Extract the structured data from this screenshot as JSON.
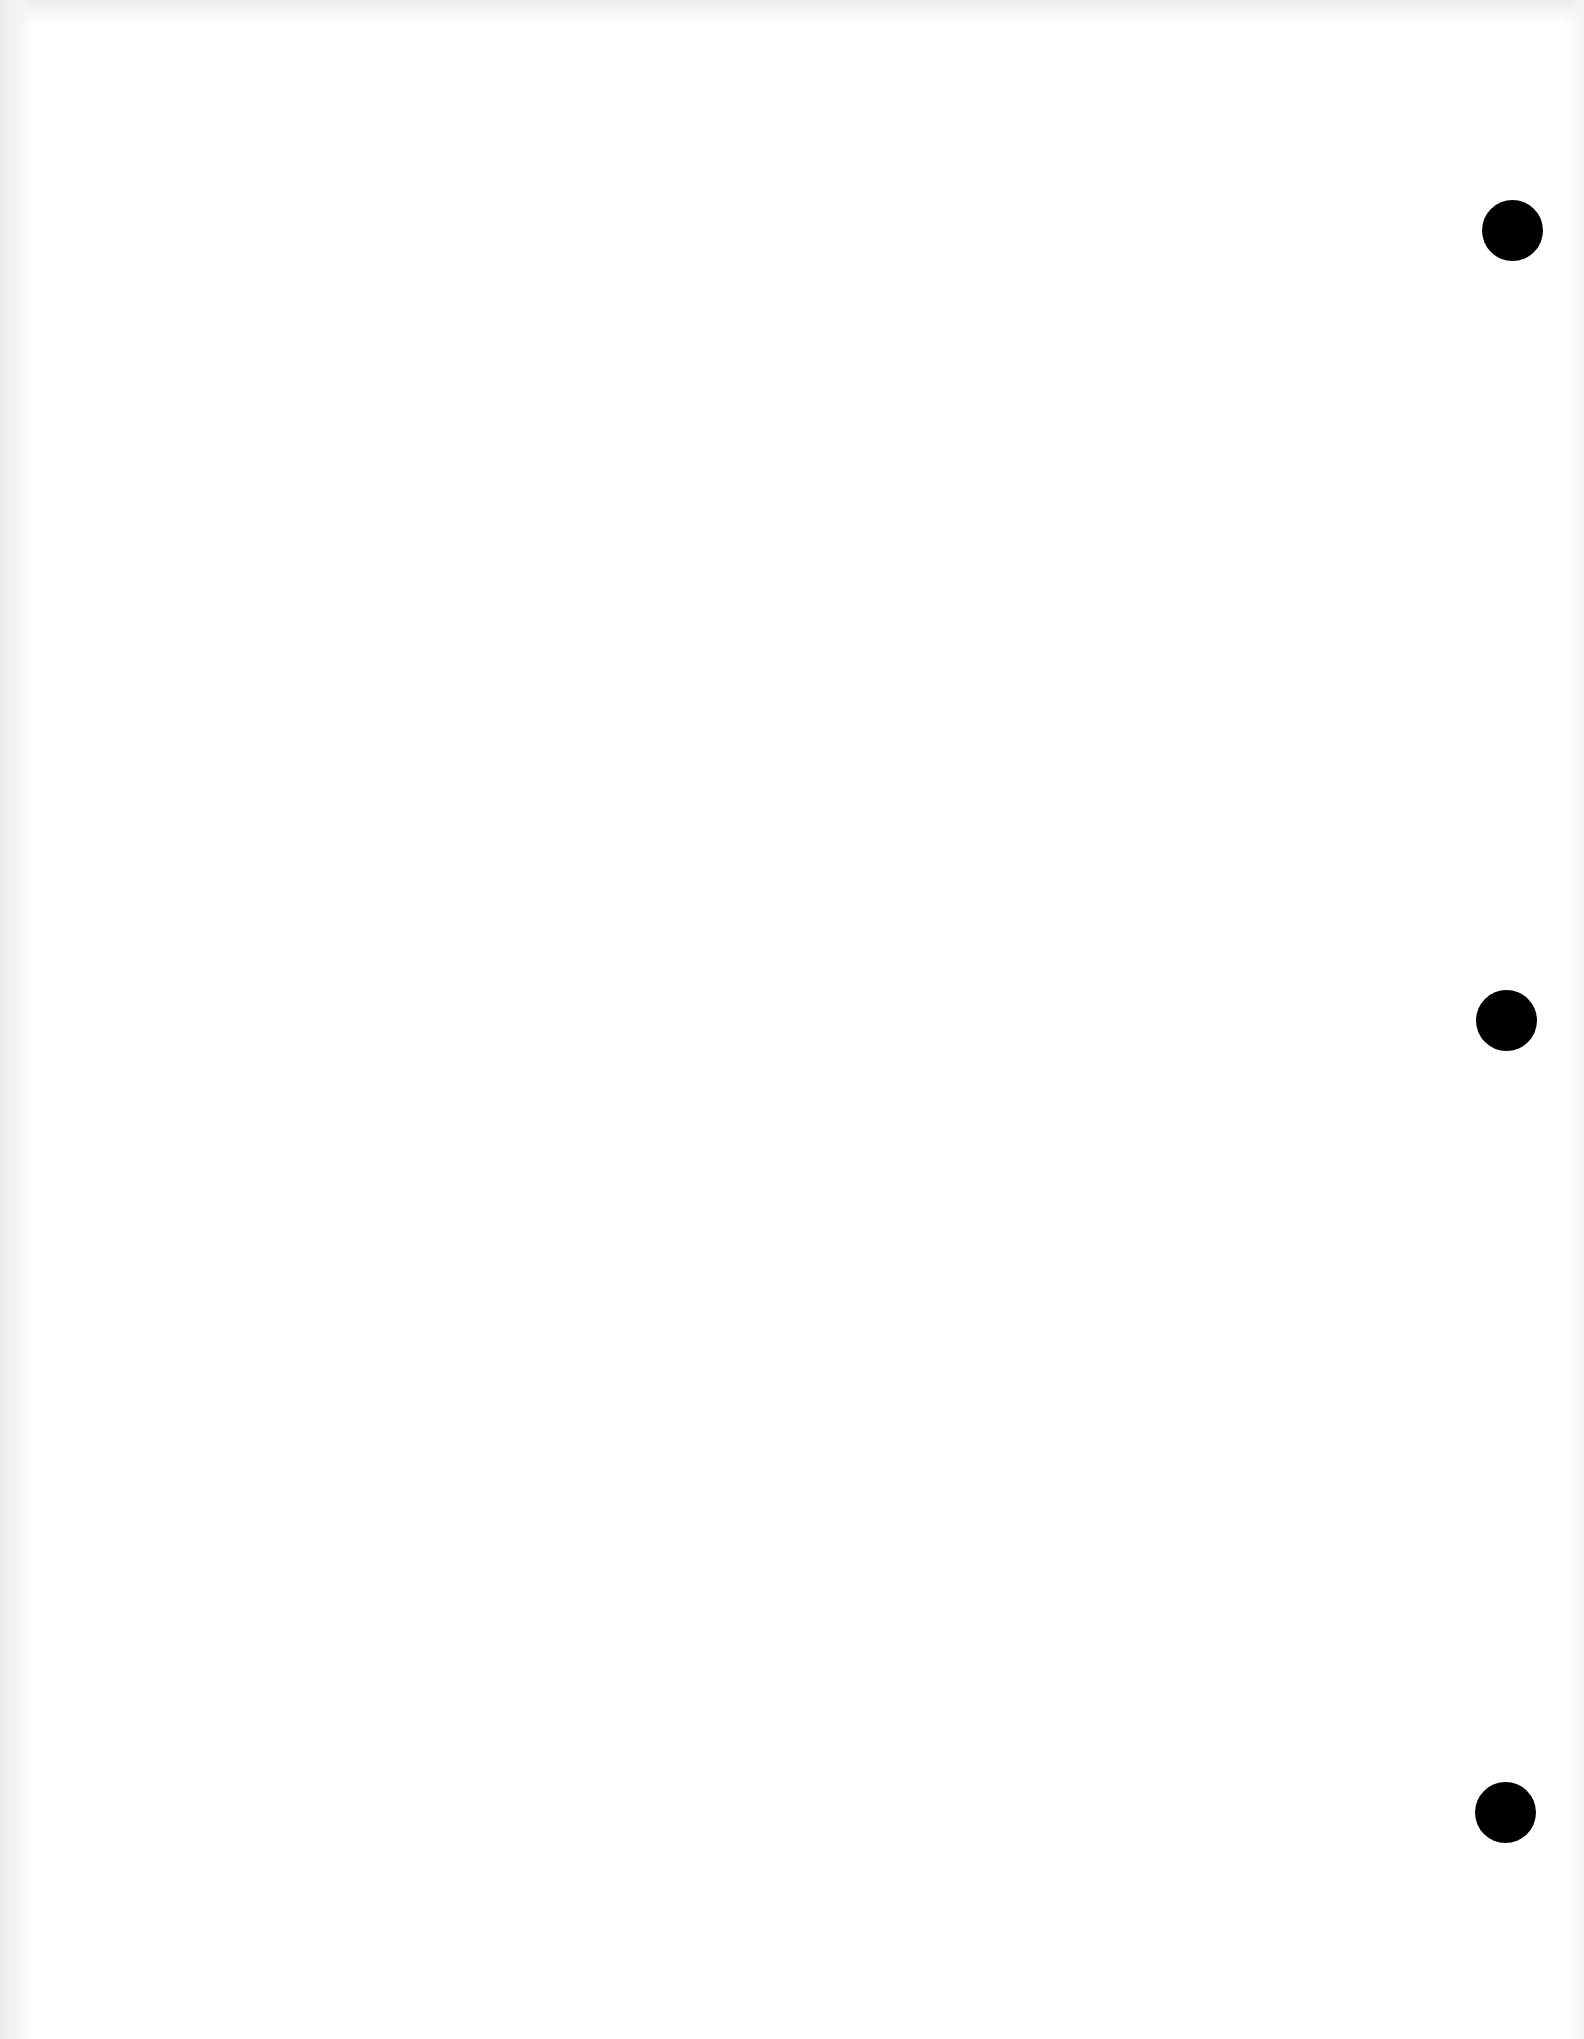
{
  "document": {
    "type": "blank scanned page",
    "text": "",
    "background_color": "#ffffff",
    "hole_color": "#000000",
    "punch_holes": [
      {
        "cx": 1512,
        "cy": 230,
        "r": 30
      },
      {
        "cx": 1506,
        "cy": 1020,
        "r": 30
      },
      {
        "cx": 1505,
        "cy": 1812,
        "r": 30
      }
    ]
  }
}
